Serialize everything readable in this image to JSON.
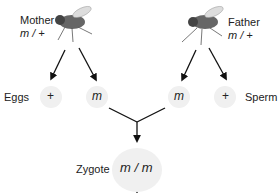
{
  "mother": {
    "label": "Mother",
    "genotype": "m / +"
  },
  "father": {
    "label": "Father",
    "genotype": "m / +"
  },
  "eggs": {
    "label": "Eggs",
    "alleles": [
      "+",
      "m"
    ]
  },
  "sperm": {
    "label": "Sperm",
    "alleles": [
      "m",
      "+"
    ]
  },
  "zygote": {
    "label": "Zygote",
    "genotype": "m / m"
  },
  "colors": {
    "arrow": "#111111",
    "circle": "#f0f0f0",
    "text": "#222222"
  }
}
